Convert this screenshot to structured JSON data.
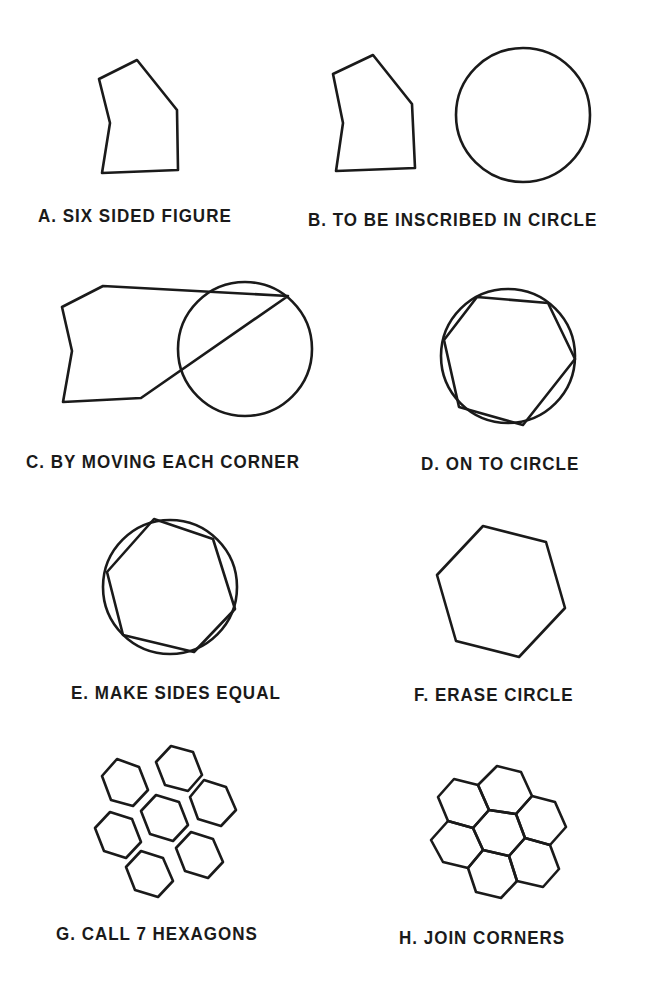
{
  "panels": [
    {
      "id": "A",
      "caption": "A. SIX SIDED FIGURE"
    },
    {
      "id": "B",
      "caption": "B. TO BE INSCRIBED IN CIRCLE"
    },
    {
      "id": "C",
      "caption": "C. BY MOVING EACH CORNER"
    },
    {
      "id": "D",
      "caption": "D. ON TO CIRCLE"
    },
    {
      "id": "E",
      "caption": "E. MAKE SIDES EQUAL"
    },
    {
      "id": "F",
      "caption": "F. ERASE CIRCLE"
    },
    {
      "id": "G",
      "caption": "G. CALL 7 HEXAGONS"
    },
    {
      "id": "H",
      "caption": "H. JOIN CORNERS"
    }
  ],
  "colors": {
    "stroke": "#1a1a1a",
    "background": "#ffffff"
  }
}
